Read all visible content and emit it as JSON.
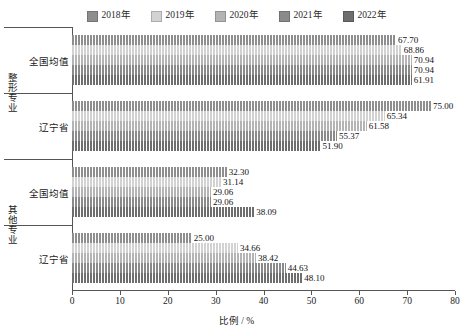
{
  "chart_data": {
    "type": "bar",
    "orientation": "horizontal",
    "title": "",
    "xlabel": "比例 / %",
    "ylabel": "",
    "xlim": [
      0,
      80
    ],
    "xticks": [
      0,
      10,
      20,
      30,
      40,
      50,
      60,
      70,
      80
    ],
    "grid": false,
    "legend_position": "top-center",
    "group_labels": [
      "整形专业",
      "其他专业"
    ],
    "categories": [
      "全国均值",
      "辽宁省",
      "全国均值",
      "辽宁省"
    ],
    "series": [
      {
        "name": "2018年",
        "color": "#8e8e8e",
        "values": [
          67.7,
          75.0,
          32.3,
          25.0
        ]
      },
      {
        "name": "2019年",
        "color": "#d2d2d2",
        "values": [
          68.86,
          65.34,
          31.14,
          34.66
        ]
      },
      {
        "name": "2020年",
        "color": "#b4b4b4",
        "values": [
          70.94,
          61.58,
          29.06,
          38.42
        ]
      },
      {
        "name": "2021年",
        "color": "#8a8a8a",
        "values": [
          70.94,
          55.37,
          29.06,
          44.63
        ]
      },
      {
        "name": "2022年",
        "color": "#6e6e6e",
        "values": [
          70.94,
          51.9,
          38.09,
          48.1
        ]
      }
    ],
    "value_labels": [
      [
        "67.70",
        "68.86",
        "70.94",
        "70.94",
        "61.91"
      ],
      [
        "75.00",
        "65.34",
        "61.58",
        "55.37",
        "51.90"
      ],
      [
        "32.30",
        "31.14",
        "29.06",
        "29.06",
        "38.09"
      ],
      [
        "25.00",
        "34.66",
        "38.42",
        "44.63",
        "48.10"
      ]
    ]
  },
  "legend": {
    "items": [
      {
        "label": "2018年"
      },
      {
        "label": "2019年"
      },
      {
        "label": "2020年"
      },
      {
        "label": "2021年"
      },
      {
        "label": "2022年"
      }
    ]
  },
  "axis": {
    "x_title": "比例 / %",
    "x_tick_labels": [
      "0",
      "10",
      "20",
      "30",
      "40",
      "50",
      "60",
      "70",
      "80"
    ]
  },
  "y_axis": {
    "groups": [
      {
        "label": "整形专业",
        "categories": [
          "全国均值",
          "辽宁省"
        ]
      },
      {
        "label": "其他专业",
        "categories": [
          "全国均值",
          "辽宁省"
        ]
      }
    ]
  }
}
